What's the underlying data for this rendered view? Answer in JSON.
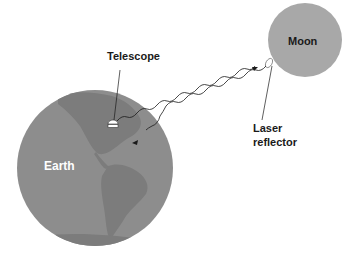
{
  "diagram": {
    "labels": {
      "telescope": "Telescope",
      "moon": "Moon",
      "earth": "Earth",
      "reflector_line1": "Laser",
      "reflector_line2": "reflector"
    },
    "colors": {
      "earth": "#8d8d8d",
      "continents": "#7c7c7c",
      "moon": "#a8a8a8",
      "lines": "#1a1a1a",
      "background": "#ffffff"
    },
    "elements": [
      {
        "id": "earth",
        "shape": "circle",
        "cx": 95,
        "cy": 168,
        "r": 78
      },
      {
        "id": "moon",
        "shape": "circle",
        "cx": 305,
        "cy": 40,
        "r": 37
      },
      {
        "id": "telescope",
        "x": 112,
        "y": 122
      },
      {
        "id": "laser-reflector",
        "x": 268,
        "y": 62
      },
      {
        "id": "outgoing-beam",
        "from": "telescope",
        "to": "laser-reflector"
      },
      {
        "id": "return-beam",
        "from": "laser-reflector",
        "to": "earth"
      }
    ]
  }
}
